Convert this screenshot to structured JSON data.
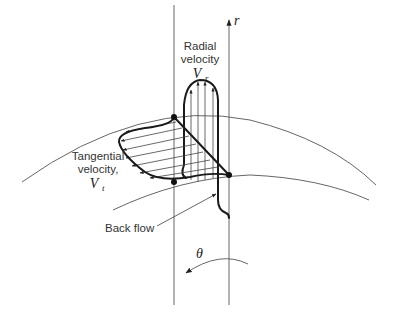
{
  "figure": {
    "axis_label": "r",
    "angle_label": "θ",
    "radial": {
      "line1": "Radial",
      "line2": "velocity",
      "symbol": "V",
      "subscript": "r"
    },
    "tangential": {
      "line1": "Tangential",
      "line2": "velocity,",
      "symbol": "V",
      "subscript": "t"
    },
    "back_flow_label": "Back flow"
  },
  "colors": {
    "line": "#1a1a1a",
    "thin_line": "#555555",
    "text": "#333333",
    "background": "#ffffff"
  }
}
